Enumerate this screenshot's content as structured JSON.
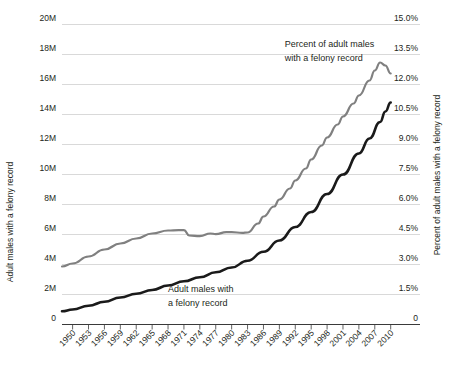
{
  "chart_data": {
    "type": "line",
    "title": "",
    "xlabel": "",
    "ylabel": "Adult males with a felony record",
    "y2label": "Percent of adult males with a felony record",
    "grid": true,
    "legend_position": "inline-annotations",
    "xlim": [
      1948,
      2011
    ],
    "ylim": [
      0,
      20000000
    ],
    "y2lim": [
      0,
      15
    ],
    "x_ticks": [
      "1950",
      "1953",
      "1956",
      "1959",
      "1962",
      "1965",
      "1968",
      "1971",
      "1974",
      "1977",
      "1980",
      "1983",
      "1986",
      "1989",
      "1992",
      "1995",
      "1998",
      "2001",
      "2004",
      "2007",
      "2010"
    ],
    "x_tick_values": [
      1950,
      1953,
      1956,
      1959,
      1962,
      1965,
      1968,
      1971,
      1974,
      1977,
      1980,
      1983,
      1986,
      1989,
      1992,
      1995,
      1998,
      2001,
      2004,
      2007,
      2010
    ],
    "y_ticks": [
      "0",
      "2M",
      "4M",
      "6M",
      "8M",
      "10M",
      "12M",
      "14M",
      "16M",
      "18M",
      "20M"
    ],
    "y_tick_values": [
      0,
      2000000,
      4000000,
      6000000,
      8000000,
      10000000,
      12000000,
      14000000,
      16000000,
      18000000,
      20000000
    ],
    "y2_ticks": [
      "0",
      "1.5%",
      "3.0%",
      "4.5%",
      "6.0%",
      "7.5%",
      "9.0%",
      "10.5%",
      "12.0%",
      "13.5%",
      "15.0%"
    ],
    "y2_tick_values": [
      0,
      1.5,
      3.0,
      4.5,
      6.0,
      7.5,
      9.0,
      10.5,
      12.0,
      13.5,
      15.0
    ],
    "annotations": [
      {
        "id": "percent-annotation",
        "line1": "Percent of adult males",
        "line2": "with a felony record",
        "x": 1990.0,
        "y_px": 47
      },
      {
        "id": "count-annotation",
        "line1": "Adult males with",
        "line2": "a felony record",
        "x": 1968.0,
        "y_px": 292
      }
    ],
    "series": [
      {
        "name": "Percent of adult males with a felony record",
        "axis": "right",
        "color": "#808080",
        "units": "percent",
        "x": [
          1948,
          1950,
          1953,
          1956,
          1959,
          1962,
          1965,
          1968,
          1970,
          1971,
          1972,
          1974,
          1976,
          1977,
          1979,
          1980,
          1982,
          1983,
          1985,
          1986,
          1988,
          1989,
          1991,
          1992,
          1994,
          1995,
          1997,
          1998,
          2000,
          2001,
          2003,
          2004,
          2006,
          2007,
          2008,
          2009,
          2010
        ],
        "values": [
          2.9,
          3.05,
          3.4,
          3.75,
          4.05,
          4.3,
          4.55,
          4.7,
          4.72,
          4.72,
          4.45,
          4.42,
          4.55,
          4.52,
          4.62,
          4.62,
          4.58,
          4.6,
          5.05,
          5.4,
          5.9,
          6.25,
          6.8,
          7.2,
          7.8,
          8.25,
          8.95,
          9.35,
          10.0,
          10.4,
          11.05,
          11.45,
          12.2,
          12.7,
          13.1,
          12.95,
          12.55
        ]
      },
      {
        "name": "Adult males with a felony record",
        "axis": "left",
        "color": "#1a1a1a",
        "units": "count",
        "x": [
          1948,
          1950,
          1953,
          1956,
          1959,
          1962,
          1965,
          1968,
          1971,
          1974,
          1977,
          1980,
          1983,
          1986,
          1989,
          1992,
          1995,
          1998,
          2001,
          2004,
          2006,
          2008,
          2009,
          2010
        ],
        "values": [
          880000,
          1000000,
          1250000,
          1520000,
          1800000,
          2050000,
          2300000,
          2600000,
          2880000,
          3150000,
          3480000,
          3800000,
          4250000,
          4850000,
          5600000,
          6500000,
          7500000,
          8700000,
          10000000,
          11400000,
          12400000,
          13500000,
          14200000,
          14800000
        ]
      }
    ]
  },
  "axes": {
    "left_title": "Adult males with a felony record",
    "right_title": "Percent of adult males with a felony record",
    "zero_left_label": "0",
    "zero_right_label": "0"
  }
}
